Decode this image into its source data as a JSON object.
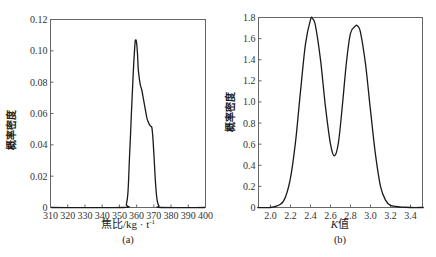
{
  "chart_data": [
    {
      "type": "line",
      "panel": "(a)",
      "title": "",
      "xlabel": "焦比/kg·t⁻¹",
      "ylabel": "概率密度",
      "xlim": [
        310,
        400
      ],
      "ylim": [
        0,
        0.12
      ],
      "xticks": [
        310,
        320,
        330,
        340,
        350,
        360,
        370,
        380,
        390,
        400
      ],
      "yticks": [
        0,
        0.02,
        0.04,
        0.06,
        0.08,
        0.1,
        0.12
      ],
      "ytick_labels": [
        "0",
        "0.02",
        "0.04",
        "0.06",
        "0.08",
        "0.10",
        "0.12"
      ],
      "grid": false,
      "x": [
        352,
        354,
        355,
        356,
        357,
        358,
        359,
        359.5,
        360,
        360.5,
        361,
        362,
        363,
        364,
        365,
        366,
        367,
        368,
        369,
        370,
        371,
        372,
        373,
        374
      ],
      "y": [
        0,
        0.002,
        0.01,
        0.035,
        0.06,
        0.085,
        0.104,
        0.107,
        0.105,
        0.098,
        0.088,
        0.079,
        0.075,
        0.069,
        0.063,
        0.057,
        0.054,
        0.052,
        0.05,
        0.035,
        0.015,
        0.004,
        0.001,
        0
      ]
    },
    {
      "type": "line",
      "panel": "(b)",
      "title": "",
      "xlabel": "K值",
      "ylabel": "概率密度",
      "xlim": [
        1.88,
        3.52
      ],
      "ylim": [
        0,
        1.8
      ],
      "xticks": [
        2.0,
        2.2,
        2.4,
        2.6,
        2.8,
        3.0,
        3.2,
        3.4
      ],
      "xtick_labels": [
        "2.0",
        "2.2",
        "2.4",
        "2.6",
        "2.8",
        "3.0",
        "3.2",
        "3.4"
      ],
      "yticks": [
        0,
        0.2,
        0.4,
        0.6,
        0.8,
        1.0,
        1.2,
        1.4,
        1.6,
        1.8
      ],
      "ytick_labels": [
        "0",
        "0.2",
        "0.4",
        "0.6",
        "0.8",
        "1.0",
        "1.2",
        "1.4",
        "1.6",
        "1.8"
      ],
      "grid": false,
      "x": [
        1.88,
        2.0,
        2.1,
        2.15,
        2.2,
        2.25,
        2.3,
        2.35,
        2.4,
        2.42,
        2.45,
        2.5,
        2.55,
        2.6,
        2.64,
        2.68,
        2.72,
        2.76,
        2.8,
        2.85,
        2.87,
        2.9,
        2.95,
        3.0,
        3.05,
        3.1,
        3.15,
        3.2,
        3.3,
        3.4,
        3.52
      ],
      "y": [
        0,
        0.0,
        0.03,
        0.1,
        0.28,
        0.62,
        1.1,
        1.55,
        1.78,
        1.79,
        1.72,
        1.4,
        0.95,
        0.6,
        0.49,
        0.62,
        0.98,
        1.38,
        1.65,
        1.72,
        1.72,
        1.66,
        1.36,
        0.92,
        0.5,
        0.2,
        0.07,
        0.02,
        0.005,
        0.0,
        0
      ]
    }
  ],
  "captions": {
    "a": "(a)",
    "b": "(b)"
  },
  "axis_labels": {
    "a_x": "焦比/kg · t",
    "a_x_sup": "-1",
    "a_y": "概率密度",
    "b_x_italic": "K",
    "b_x_rest": "值",
    "b_y": "概率密度"
  },
  "colors": {
    "line": "#1a1a1a",
    "axis": "#555555"
  }
}
